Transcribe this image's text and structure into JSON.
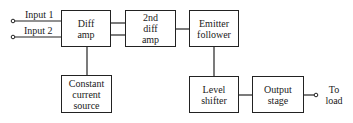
{
  "diagram": {
    "type": "block-diagram",
    "inputs": [
      {
        "id": "input1",
        "label": "Input 1"
      },
      {
        "id": "input2",
        "label": "Input 2"
      }
    ],
    "blocks": [
      {
        "id": "diff_amp",
        "lines": [
          "Diff",
          "amp"
        ]
      },
      {
        "id": "second_diff_amp",
        "lines": [
          "2nd",
          "diff",
          "amp"
        ]
      },
      {
        "id": "emitter_follower",
        "lines": [
          "Emitter",
          "follower"
        ]
      },
      {
        "id": "constant_current_source",
        "lines": [
          "Constant",
          "current",
          "source"
        ]
      },
      {
        "id": "level_shifter",
        "lines": [
          "Level",
          "shifter"
        ]
      },
      {
        "id": "output_stage",
        "lines": [
          "Output",
          "stage"
        ]
      }
    ],
    "output": {
      "lines": [
        "To",
        "load"
      ]
    },
    "connections": [
      {
        "from": "input1",
        "to": "diff_amp"
      },
      {
        "from": "input2",
        "to": "diff_amp"
      },
      {
        "from": "diff_amp",
        "to": "second_diff_amp",
        "wires": 2
      },
      {
        "from": "second_diff_amp",
        "to": "emitter_follower",
        "wires": 1
      },
      {
        "from": "diff_amp",
        "to": "constant_current_source"
      },
      {
        "from": "emitter_follower",
        "to": "level_shifter"
      },
      {
        "from": "level_shifter",
        "to": "output_stage"
      },
      {
        "from": "output_stage",
        "to": "load"
      }
    ],
    "colors": {
      "line": "#222222",
      "background": "#ffffff"
    }
  }
}
